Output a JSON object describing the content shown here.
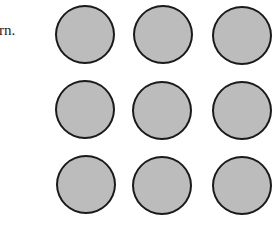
{
  "text_fragment": "rn.",
  "figure": {
    "rows": 3,
    "columns": 3,
    "fill_color": "#bcbcbc",
    "stroke_color": "#1a1a1a",
    "circles": [
      {
        "row": 1,
        "col": 1,
        "cx": 85,
        "cy": 34
      },
      {
        "row": 1,
        "col": 2,
        "cx": 163,
        "cy": 34
      },
      {
        "row": 1,
        "col": 3,
        "cx": 242,
        "cy": 35
      },
      {
        "row": 2,
        "col": 1,
        "cx": 85,
        "cy": 109
      },
      {
        "row": 2,
        "col": 2,
        "cx": 162,
        "cy": 110
      },
      {
        "row": 2,
        "col": 3,
        "cx": 242,
        "cy": 110
      },
      {
        "row": 3,
        "col": 1,
        "cx": 86,
        "cy": 184
      },
      {
        "row": 3,
        "col": 2,
        "cx": 162,
        "cy": 185
      },
      {
        "row": 3,
        "col": 3,
        "cx": 242,
        "cy": 185
      }
    ]
  }
}
